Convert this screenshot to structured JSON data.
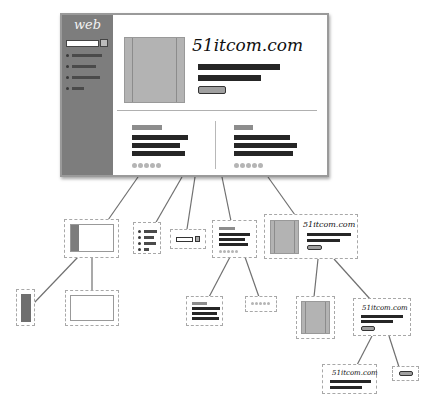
{
  "diagram": {
    "type": "page-component-tree",
    "root": {
      "label": "webpage-mockup",
      "sidebar": {
        "logo_text": "web",
        "search_box": true,
        "nav_items_count": 4
      },
      "hero": {
        "title": "51itcom.com",
        "text_lines": 2,
        "button": true
      },
      "cards": [
        {
          "heading": true,
          "text_lines": 3,
          "dots": 5
        },
        {
          "heading": true,
          "text_lines": 3,
          "dots": 5
        }
      ]
    },
    "level1": [
      {
        "id": "layout",
        "label": "sidebar + content frame"
      },
      {
        "id": "nav-list",
        "label": "nav menu list"
      },
      {
        "id": "search-bar",
        "label": "search input + button"
      },
      {
        "id": "card",
        "label": "content card"
      },
      {
        "id": "hero",
        "label": "hero banner",
        "title": "51itcom.com"
      }
    ],
    "level2": [
      {
        "parent": "layout",
        "id": "sidebar-block",
        "label": "sidebar"
      },
      {
        "parent": "layout",
        "id": "content-block",
        "label": "content area"
      },
      {
        "parent": "card",
        "id": "card-text",
        "label": "heading + text lines"
      },
      {
        "parent": "card",
        "id": "card-dots",
        "label": "pagination dots"
      },
      {
        "parent": "hero",
        "id": "hero-image",
        "label": "image"
      },
      {
        "parent": "hero",
        "id": "hero-content",
        "label": "title + text + button",
        "title": "51itcom.com"
      }
    ],
    "level3": [
      {
        "parent": "hero-content",
        "id": "hero-text",
        "label": "title + text lines",
        "title": "51itcom.com"
      },
      {
        "parent": "hero-content",
        "id": "hero-button",
        "label": "button"
      }
    ]
  },
  "texts": {
    "logo": "web",
    "brand": "51itcom.com"
  },
  "colors": {
    "sidebar": "#7d7d7d",
    "image_fill": "#b3b3b3",
    "text_bar": "#262626",
    "heading_bar": "#8d8d8d",
    "dashed_border": "#a8a8a8",
    "connector": "#6f6f6f"
  }
}
